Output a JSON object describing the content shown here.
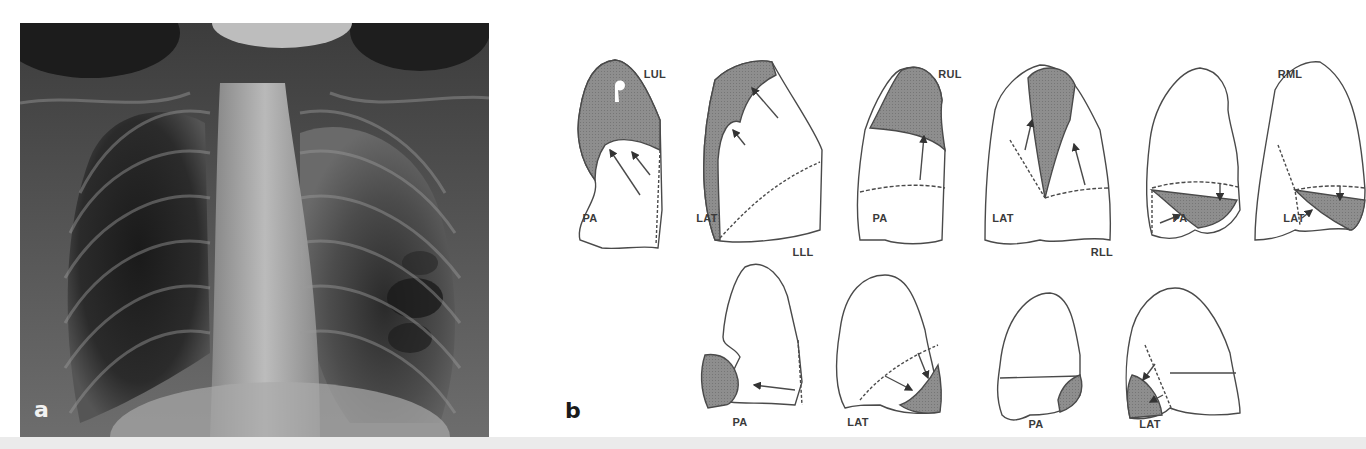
{
  "figure": {
    "panel_a": {
      "letter": "a",
      "description": "Frontal chest radiograph"
    },
    "panel_b": {
      "letter": "b",
      "description": "Schematic diagrams of lobar collapse patterns in PA and lateral views",
      "lobes": [
        {
          "id": "LUL",
          "title": "LUL",
          "views": [
            "PA",
            "LAT"
          ]
        },
        {
          "id": "RUL",
          "title": "RUL",
          "views": [
            "PA",
            "LAT"
          ]
        },
        {
          "id": "RML",
          "title": "RML",
          "views": [
            "PA",
            "LAT"
          ]
        },
        {
          "id": "LLL",
          "title": "LLL",
          "views": [
            "PA",
            "LAT"
          ]
        },
        {
          "id": "RLL",
          "title": "RLL",
          "views": [
            "PA",
            "LAT"
          ]
        }
      ]
    },
    "colors": {
      "shade": "#8a8a8a",
      "outline": "#4a4a4a",
      "label": "#3a3a3a",
      "strip": "#ebebeb"
    }
  }
}
